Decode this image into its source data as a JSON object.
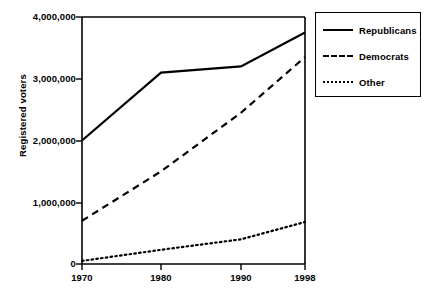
{
  "chart_data": {
    "type": "line",
    "title": "",
    "subtitle": "",
    "xlabel": "",
    "ylabel": "Registered voters",
    "x": [
      1970,
      1980,
      1990,
      1998
    ],
    "categories": [
      "1970",
      "1980",
      "1990",
      "1998"
    ],
    "xlim": [
      1970,
      1998
    ],
    "ylim": [
      0,
      4000000
    ],
    "grid": false,
    "legend_position": "right-top",
    "xticks": [
      "1970",
      "1980",
      "1990",
      "1998"
    ],
    "yticks": [
      "0",
      "1,000,000",
      "2,000,000",
      "3,000,000",
      "4,000,000"
    ],
    "ytick_values": [
      0,
      1000000,
      2000000,
      3000000,
      4000000
    ],
    "series": [
      {
        "name": "Republicans",
        "style": "solid",
        "color": "#000000",
        "values": [
          2000000,
          3100000,
          3200000,
          3750000
        ]
      },
      {
        "name": "Democrats",
        "style": "dashed",
        "color": "#000000",
        "values": [
          700000,
          1500000,
          2450000,
          3350000
        ]
      },
      {
        "name": "Other",
        "style": "dotted",
        "color": "#000000",
        "values": [
          50000,
          230000,
          400000,
          680000
        ]
      }
    ]
  },
  "axes": {
    "y_title": "Registered voters",
    "y_ticks": [
      {
        "label": "4,000,000",
        "value": 4000000
      },
      {
        "label": "3,000,000",
        "value": 3000000
      },
      {
        "label": "2,000,000",
        "value": 2000000
      },
      {
        "label": "1,000,000",
        "value": 1000000
      },
      {
        "label": "0",
        "value": 0
      }
    ],
    "x_ticks": [
      {
        "label": "1970",
        "value": 1970
      },
      {
        "label": "1980",
        "value": 1980
      },
      {
        "label": "1990",
        "value": 1990
      },
      {
        "label": "1998",
        "value": 1998
      }
    ]
  },
  "legend": {
    "items": [
      {
        "label": "Republicans",
        "style": "solid"
      },
      {
        "label": "Democrats",
        "style": "dashed"
      },
      {
        "label": "Other",
        "style": "dotted"
      }
    ]
  }
}
